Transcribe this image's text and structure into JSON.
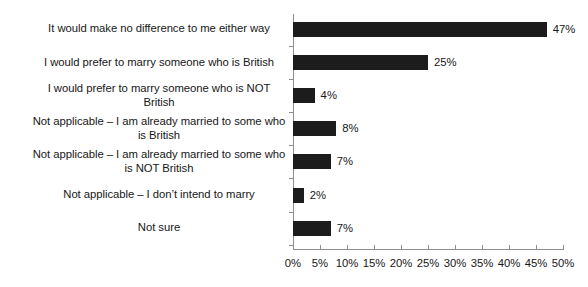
{
  "chart_data": {
    "type": "bar",
    "orientation": "horizontal",
    "title": "",
    "subtitle": "",
    "xlabel": "",
    "ylabel": "",
    "xlim": [
      0,
      50
    ],
    "grid": false,
    "legend": false,
    "bar_color": "#1c1c1c",
    "axis_color": "#8d8d8d",
    "categories": [
      "It would make no difference to me either way",
      "I would prefer to marry someone who is British",
      "I would prefer to marry someone who is NOT\nBritish",
      "Not applicable – I am already married to some who\nis British",
      "Not applicable – I am already married to some who\nis NOT British",
      "Not applicable – I don’t intend to marry",
      "Not sure"
    ],
    "values": [
      47,
      25,
      4,
      8,
      7,
      2,
      7
    ],
    "value_labels": [
      "47%",
      "25%",
      "4%",
      "8%",
      "7%",
      "2%",
      "7%"
    ],
    "xticks": [
      0,
      5,
      10,
      15,
      20,
      25,
      30,
      35,
      40,
      45,
      50
    ],
    "xtick_labels": [
      "0%",
      "5%",
      "10%",
      "15%",
      "20%",
      "25%",
      "30%",
      "35%",
      "40%",
      "45%",
      "50%"
    ]
  }
}
